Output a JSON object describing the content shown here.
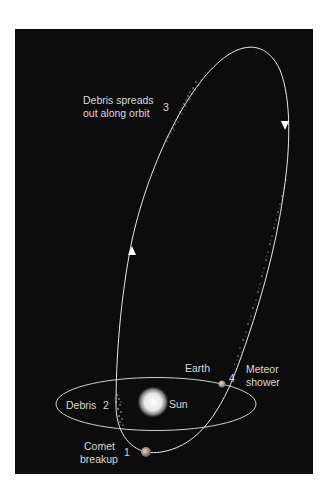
{
  "diagram": {
    "background_color": "#0c0c0c",
    "text_color": "#d8d8d8",
    "labels": {
      "debris_spreads_line1": "Debris spreads",
      "debris_spreads_line2": "out along orbit",
      "debris": "Debris",
      "sun": "Sun",
      "earth": "Earth",
      "meteor_shower_line1": "Meteor",
      "meteor_shower_line2": "shower",
      "comet_breakup_line1": "Comet",
      "comet_breakup_line2": "breakup"
    },
    "steps": {
      "step1": "1",
      "step2": "2",
      "step3": "3",
      "step4": "4"
    },
    "objects": {
      "sun": "sun-glow-icon",
      "earth": "earth-icon",
      "comet": "comet-nucleus-icon",
      "orbit_direction": "arrow-icon"
    }
  }
}
